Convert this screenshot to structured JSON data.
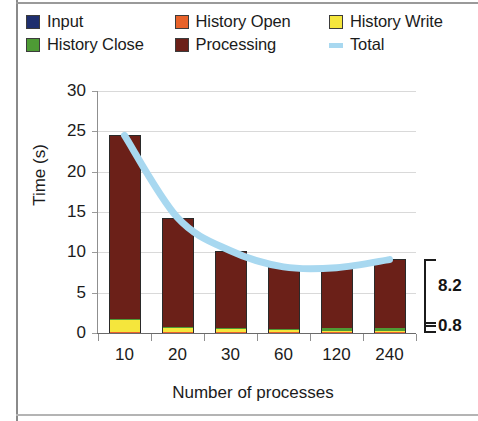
{
  "chart_data": {
    "type": "bar",
    "stacked": true,
    "title": "",
    "xlabel": "Number of processes",
    "ylabel": "Time (s)",
    "categories": [
      "10",
      "20",
      "30",
      "60",
      "120",
      "240"
    ],
    "ylim": [
      0,
      30
    ],
    "yticks": [
      "0",
      "5",
      "10",
      "15",
      "20",
      "25",
      "30"
    ],
    "grid": true,
    "legend_position": "top",
    "series": [
      {
        "name": "Input",
        "color": "#1f2f6e",
        "values": [
          0.1,
          0.1,
          0.1,
          0.1,
          0.1,
          0.1
        ]
      },
      {
        "name": "History Open",
        "color": "#e8622a",
        "values": [
          0.05,
          0.05,
          0.05,
          0.05,
          0.05,
          0.05
        ]
      },
      {
        "name": "History Write",
        "color": "#f5e63c",
        "values": [
          1.5,
          0.5,
          0.45,
          0.3,
          0.15,
          0.1
        ]
      },
      {
        "name": "History Close",
        "color": "#4e9b35",
        "values": [
          0.05,
          0.05,
          0.05,
          0.05,
          0.3,
          0.35
        ]
      },
      {
        "name": "Processing",
        "color": "#6b2018",
        "values": [
          22.8,
          13.6,
          9.55,
          7.7,
          7.5,
          8.55
        ]
      }
    ],
    "overlay": {
      "name": "Total",
      "color": "#a8d8f0",
      "type": "line",
      "values": [
        24.5,
        14.3,
        10.2,
        8.2,
        8.1,
        9.1
      ]
    },
    "annotations": [
      {
        "label": "8.2",
        "value": 8.2,
        "kind": "bracket-range"
      },
      {
        "label": "0.8",
        "value": 0.8,
        "kind": "bracket-range"
      }
    ]
  },
  "legend": {
    "rows": [
      [
        {
          "label": "Input",
          "swatch": "legend-swatch-input",
          "color": "#1f2f6e",
          "style": "box"
        },
        {
          "label": "History Open",
          "swatch": "legend-swatch-history-open",
          "color": "#e8622a",
          "style": "box"
        },
        {
          "label": "History Write",
          "swatch": "legend-swatch-history-write",
          "color": "#f5e63c",
          "style": "box"
        }
      ],
      [
        {
          "label": "History Close",
          "swatch": "legend-swatch-history-close",
          "color": "#4e9b35",
          "style": "box"
        },
        {
          "label": "Processing",
          "swatch": "legend-swatch-processing",
          "color": "#6b2018",
          "style": "box"
        },
        {
          "label": "Total",
          "swatch": "legend-swatch-total",
          "color": "#a8d8f0",
          "style": "line"
        }
      ]
    ]
  },
  "axes": {
    "y_title": "Time (s)",
    "x_title": "Number of processes",
    "y_ticks": [
      "30",
      "25",
      "20",
      "15",
      "10",
      "5",
      "0"
    ],
    "x_ticks": [
      "10",
      "20",
      "30",
      "60",
      "120",
      "240"
    ]
  },
  "annotations": {
    "upper": "8.2",
    "lower": "0.8"
  }
}
